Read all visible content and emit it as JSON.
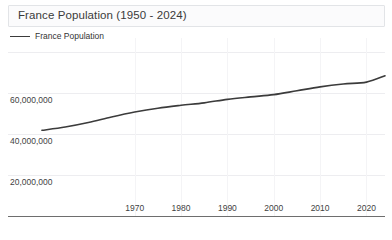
{
  "widget": {
    "title": "France Population (1950 - 2024)",
    "background_color": "#ffffff"
  },
  "legend": {
    "entries": [
      {
        "label": "France Population",
        "color": "#3b3b3b"
      }
    ]
  },
  "axis": {
    "y_tick_labels": [
      "60,000,000",
      "40,000,000",
      "20,000,000"
    ],
    "x_tick_labels": [
      "1970",
      "1980",
      "1990",
      "2000",
      "2010",
      "2020"
    ]
  },
  "chart_data": {
    "type": "line",
    "title": "France Population (1950 - 2024)",
    "xlabel": "",
    "ylabel": "",
    "xlim": [
      1950,
      2024
    ],
    "ylim": [
      0,
      80000000
    ],
    "grid": true,
    "legend_position": "top-left",
    "x_ticks": [
      1970,
      1980,
      1990,
      2000,
      2010,
      2020
    ],
    "y_ticks": [
      20000000,
      40000000,
      60000000
    ],
    "series": [
      {
        "name": "France Population",
        "color": "#3b3b3b",
        "x": [
          1950,
          1955,
          1960,
          1965,
          1970,
          1975,
          1980,
          1985,
          1990,
          1995,
          2000,
          2005,
          2010,
          2015,
          2020,
          2024
        ],
        "values": [
          41800000,
          43400000,
          45600000,
          48300000,
          50700000,
          52600000,
          54000000,
          55200000,
          56900000,
          58100000,
          59200000,
          61100000,
          63000000,
          64400000,
          65300000,
          68400000
        ]
      }
    ]
  }
}
